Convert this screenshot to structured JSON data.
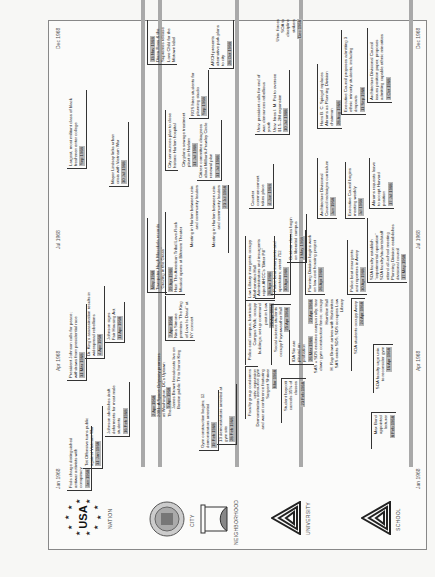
{
  "timeline": {
    "months": {
      "start": "Jan 1968",
      "apr": "Apr 1968",
      "jul": "Jul 1968",
      "end": "Dec 1968"
    },
    "rows": [
      {
        "label": "NATION",
        "logo": "usa-stars-logo"
      },
      {
        "label": "CITY",
        "logo": "city-seal-logo"
      },
      {
        "label": "NEIGHBORHOOD",
        "logo": "neighborhood-seal-logo"
      },
      {
        "label": "UNIVERSITY",
        "logo": "university-triangle-logo"
      },
      {
        "label": "SCHOOL",
        "logo": "school-triangle-logo"
      }
    ],
    "nation": [
      {
        "text": "Feds charge distinguished antiwar activists with conspiracy",
        "date": "Jan 1968"
      },
      {
        "text": "Tet Offensive turns public against Vietnam War",
        "date": "31 Jan 1968"
      },
      {
        "text": "Johnson abolishes draft deferments for most male students",
        "date": "16 Feb 1968"
      },
      {
        "text": "2001: A Space Odyssey premiers at Washington, DC's Uptown Theater",
        "date": "2 Apr 1968"
      },
      {
        "text": "President Johnson calls for peace; withdraws from presidential race",
        "date": "31 Mar 1968"
      },
      {
        "text": "Dr. King's assassination results in widespread rebellions",
        "date": "4 Apr 1968"
      },
      {
        "text": "Johnson signs Fair Housing Act",
        "date": "11 Apr 1968"
      },
      {
        "text": "Trumpeter Hugh Masekela records \"Grazing in the Grass\"",
        "date": "May 1968"
      },
      {
        "text": "Largest, most militant class of black freshmen enter college",
        "date": "Sep 1968"
      },
      {
        "text": "Diana Ross & the Supremes release Love Child for the Motown label",
        "date": "13 Nov 1968"
      }
    ],
    "city": [
      {
        "text": "James Brown broadcasts live on Boston public TV to honor King",
        "date": "5 Apr 1968"
      },
      {
        "text": "Nina Simone premiers \"The King of Love Is Dead\" at NY concert",
        "date": "7 Apr 1968"
      },
      {
        "text": "Hair: The American Tribal Love-Rock Musical opens at Biltmore Theater",
        "date": "29 Apr 1968"
      },
      {
        "text": "Mayor Lindsay links urban crisis with Vietnam War",
        "date": "30 Jul 1968"
      },
      {
        "text": "City announces plan to close historic Harlem hospital"
      },
      {
        "text": "City plans sewage treatment plant in Harlem",
        "date": "31 Jul 1968"
      }
    ],
    "neighborhood": [
      {
        "text": "Gym construction begins; 12 demonstrators arrested",
        "date": "19 Feb 1968"
      },
      {
        "text": "13 demonstrators arrested at gym site",
        "date": "28 Feb 1968"
      },
      {
        "text": "Meeting in Harlem between univ. and community leaders"
      },
      {
        "text": "Meeting in Harlem between univ. and community leaders",
        "date": "23 Jul 1968"
      },
      {
        "text": "Citizen committee disagrees about Milbank-Frawley Circle renewal plan",
        "date": "31 Jul 1968"
      },
      {
        "text": "RGS hires students for planning studio",
        "date": "Sep 1968"
      },
      {
        "text": "ARCH presents alternative park plans to city",
        "date": "28 Oct 1968"
      }
    ],
    "university": [
      {
        "text": "Faculty group condemns univ. expansion",
        "date": ""
      },
      {
        "text": "Demonstrators denounce gym and war at conference featuring Sargent Shriver",
        "date": "Mar 1968"
      },
      {
        "text": "Student boycott cancels 35% of classes",
        "date": "23 Feb 1968"
      },
      {
        "text": "Police seal campus; barricade Campus Walk; occupy buildings; set up command post in Low",
        "date": "26 Apr 1968"
      },
      {
        "text": "Social science students occupy Fayerweather Hall",
        "date": "25 Apr 1968"
      },
      {
        "text": "IDA Six are placed on probation",
        "date": "26 Mar 1968"
      },
      {
        "text": "Low Library insurgents occupy Mathematics Hall"
      },
      {
        "text": "Administrators and insurgents reject AHCC's \"Bitter Pill\"",
        "date": "28 Apr 1968"
      },
      {
        "text": "Police beat insurgents and spectators; arrest 712",
        "date": "30 Apr 1968"
      },
      {
        "text": "Outdoor classes begin on liberated campus",
        "date": "1 May 1968"
      },
      {
        "text": "Counter commencement takes place",
        "date": "4 Jun 1968"
      },
      {
        "text": "Univ. president calls for end of war; denounces rebellious youth"
      },
      {
        "text": "Univ. hires I. M. Pei to oversee $1.5–2M expansion",
        "date": "10 Jul 1968"
      },
      {
        "text": "Univ. forces SOA to discipline strikers",
        "date": "Dec 1968"
      },
      {
        "text": "SAS + SDS endorse campus rally; tear down gym construction fence; occupy Hamilton Hall",
        "date": "23 Apr 1968"
      },
      {
        "text": "H. Rap Brown arrives with Harlemites"
      },
      {
        "text": "SAS evicts SDS; SDS occupies Low Library"
      },
      {
        "text": "Planning Division begins work on low-cost housing project",
        "date": "26 Apr 1968"
      }
    ],
    "school": [
      {
        "text": "Max Bond appointed lecturer",
        "date": "8 Feb 1968"
      },
      {
        "text": "SOA faculty urge univ. to reconsider gym",
        "date": "16 Apr 1968"
      },
      {
        "text": "SOA students occupy Avery",
        "date": "24 Apr 1968"
      },
      {
        "text": "Police beat insurgents and reporters in Avery",
        "date": "30 Apr 1968"
      },
      {
        "text": "SOA faculty establish \"experimental operation\""
      },
      {
        "text": "SOA faculty/students/staff attend all-school meeting"
      },
      {
        "text": "Planning Division establishes divisional council",
        "date": "17 May 1968"
      },
      {
        "text": "Architecture Divisional Council redesigns curriculum",
        "date": "Jun 1968"
      },
      {
        "text": "Executive Council begins meeting weekly",
        "date": "Jul 1968"
      },
      {
        "text": "Abrams requests leave to accept Harvard position",
        "date": "17 Jul 1968"
      },
      {
        "text": "Hans B. C. Spiegel replaces Abrams as Planning Division chairman",
        "date": "28 Aug 1968"
      },
      {
        "text": "Executive Council proposes admitting 3 ethnic minority students, including dropouts",
        "date": "11 Sep 1968"
      },
      {
        "text": "Architecture Divisional Council issues position paper; proposes admitting capable ethnic minorities",
        "date": "1 Oct 1968"
      }
    ]
  }
}
